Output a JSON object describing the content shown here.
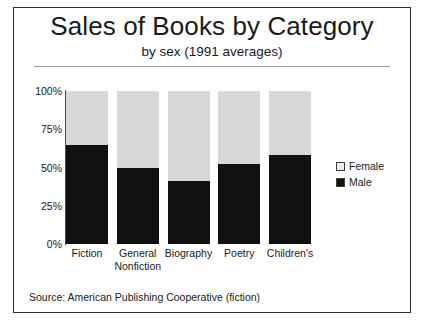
{
  "chart_data": {
    "type": "bar",
    "subtype": "stacked-percentage",
    "title": "Sales of Books by Category",
    "subtitle": "by sex (1991 averages)",
    "xlabel": "",
    "ylabel": "",
    "ylim": [
      0,
      100
    ],
    "yticks": [
      "0%",
      "25%",
      "50%",
      "75%",
      "100%"
    ],
    "ytick_values": [
      0,
      25,
      50,
      75,
      100
    ],
    "grid": false,
    "legend_position": "right",
    "categories": [
      {
        "lines": [
          "Fiction"
        ]
      },
      {
        "lines": [
          "General",
          "Nonfiction"
        ]
      },
      {
        "lines": [
          "Biography"
        ]
      },
      {
        "lines": [
          "Poetry"
        ]
      },
      {
        "lines": [
          "Children's"
        ]
      }
    ],
    "category_names": [
      "Fiction",
      "General Nonfiction",
      "Biography",
      "Poetry",
      "Children's"
    ],
    "series": [
      {
        "name": "Male",
        "color": "#111111",
        "values": [
          65,
          50,
          41,
          52,
          58
        ]
      },
      {
        "name": "Female",
        "color": "#d8d8d8",
        "values": [
          35,
          50,
          59,
          48,
          42
        ]
      }
    ],
    "source": "Source: American Publishing Cooperative (fiction)"
  },
  "legend": {
    "items": [
      {
        "label": "Female",
        "swatch": "female"
      },
      {
        "label": "Male",
        "swatch": "male"
      }
    ]
  }
}
